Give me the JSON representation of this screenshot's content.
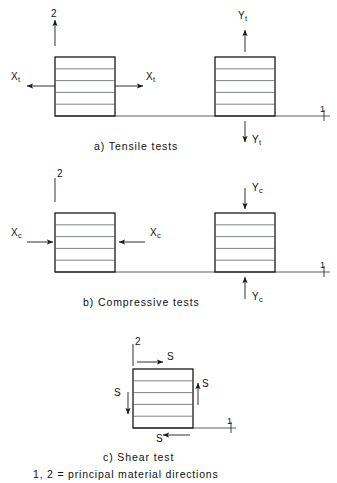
{
  "figure": {
    "title_legend": "1, 2 = principal material directions",
    "axis_labels": {
      "vertical": "2",
      "horizontal": "1"
    },
    "line_color": "#1a1a1a",
    "background": "#ffffff",
    "layers_per_block": 5
  },
  "panels": [
    {
      "id": "tensile",
      "caption": "a)  Tensile tests",
      "blocks": [
        {
          "id": "tensile-longitudinal",
          "load_symbol": "X",
          "load_subscript": "t",
          "labels": [
            {
              "name": "left-load-label",
              "text": "X",
              "sub": "t",
              "arrow": "left"
            },
            {
              "name": "right-load-label",
              "text": "X",
              "sub": "t",
              "arrow": "right"
            }
          ]
        },
        {
          "id": "tensile-transverse",
          "load_symbol": "Y",
          "load_subscript": "t",
          "labels": [
            {
              "name": "top-load-label",
              "text": "Y",
              "sub": "t",
              "arrow": "up"
            },
            {
              "name": "bottom-load-label",
              "text": "Y",
              "sub": "t",
              "arrow": "down"
            }
          ]
        }
      ]
    },
    {
      "id": "compressive",
      "caption": "b)  Compressive tests",
      "blocks": [
        {
          "id": "compressive-longitudinal",
          "load_symbol": "X",
          "load_subscript": "c",
          "labels": [
            {
              "name": "left-load-label",
              "text": "X",
              "sub": "c",
              "arrow": "right"
            },
            {
              "name": "right-load-label",
              "text": "X",
              "sub": "c",
              "arrow": "left"
            }
          ]
        },
        {
          "id": "compressive-transverse",
          "load_symbol": "Y",
          "load_subscript": "c",
          "labels": [
            {
              "name": "top-load-label",
              "text": "Y",
              "sub": "c",
              "arrow": "down"
            },
            {
              "name": "bottom-load-label",
              "text": "Y",
              "sub": "c",
              "arrow": "up"
            }
          ]
        }
      ]
    },
    {
      "id": "shear",
      "caption": "c)  Shear test",
      "blocks": [
        {
          "id": "shear-block",
          "load_symbol": "S",
          "load_subscript": "",
          "labels": [
            {
              "name": "top-shear-label",
              "text": "S",
              "sub": "",
              "arrow": "right"
            },
            {
              "name": "right-shear-label",
              "text": "S",
              "sub": "",
              "arrow": "up"
            },
            {
              "name": "left-shear-label",
              "text": "S",
              "sub": "",
              "arrow": "down"
            },
            {
              "name": "bottom-shear-label",
              "text": "S",
              "sub": "",
              "arrow": "left"
            }
          ]
        }
      ]
    }
  ],
  "text": {
    "panel_a_caption": "a)  Tensile tests",
    "panel_b_caption": "b)  Compressive tests",
    "panel_c_caption": "c)  Shear test",
    "legend": "1, 2 = principal material directions",
    "axis_2_a": "2",
    "axis_1_a": "1",
    "axis_2_b": "2",
    "axis_1_b": "1",
    "axis_2_c": "2",
    "axis_1_c": "1",
    "Xt_left": "X",
    "Xt_left_sub": "t",
    "Xt_right": "X",
    "Xt_right_sub": "t",
    "Yt_top": "Y",
    "Yt_top_sub": "t",
    "Yt_bottom": "Y",
    "Yt_bottom_sub": "t",
    "Xc_left": "X",
    "Xc_left_sub": "c",
    "Xc_right": "X",
    "Xc_right_sub": "c",
    "Yc_top": "Y",
    "Yc_top_sub": "c",
    "Yc_bottom": "Y",
    "Yc_bottom_sub": "c",
    "S_top": "S",
    "S_right": "S",
    "S_left": "S",
    "S_bottom": "S"
  }
}
